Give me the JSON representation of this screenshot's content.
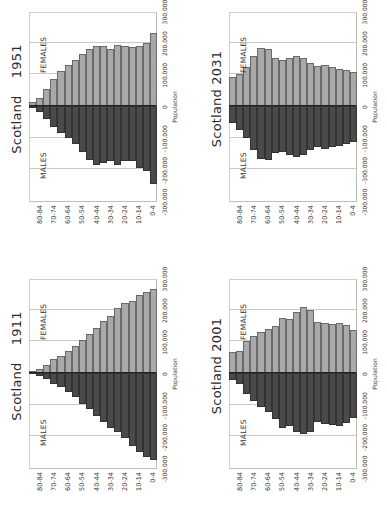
{
  "page": {
    "orientation": "rotated 90 degrees counter-clockwise",
    "shared": {
      "x_axis_title": "Population",
      "male_label": "MALES",
      "female_label": "FEMALES",
      "age_tick_labels": [
        "80-84",
        "70-74",
        "60-64",
        "50-54",
        "40-44",
        "30-34",
        "20-24",
        "10-14",
        "0-4"
      ],
      "colors": {
        "females": "#a9a9a9",
        "males": "#4a4a4a",
        "grid": "#c9c9c9"
      }
    }
  },
  "chart_data": [
    {
      "type": "bar",
      "subtype": "population-pyramid",
      "title": "Scotland    1951",
      "xlabel": "Population",
      "ylabel": "Age group",
      "xlim": [
        -300000,
        300000
      ],
      "x_tick_labels": [
        "-300,000",
        "-200,000",
        "-100,000",
        "0",
        "100,000",
        "200,000",
        "300,000"
      ],
      "grid": true,
      "categories": [
        "85+",
        "80-84",
        "75-79",
        "70-74",
        "65-69",
        "60-64",
        "55-59",
        "50-54",
        "45-49",
        "40-44",
        "35-39",
        "30-34",
        "25-29",
        "20-24",
        "15-19",
        "10-14",
        "5-9",
        "0-4"
      ],
      "category_tick_labels": [
        "80-84",
        "70-74",
        "60-64",
        "50-54",
        "40-44",
        "30-34",
        "20-24",
        "10-14",
        "0-4"
      ],
      "series": [
        {
          "name": "FEMALES",
          "values": [
            12000,
            25000,
            55000,
            85000,
            110000,
            128000,
            145000,
            165000,
            180000,
            190000,
            190000,
            180000,
            193000,
            190000,
            187000,
            190000,
            198000,
            230000
          ]
        },
        {
          "name": "MALES",
          "values": [
            -5000,
            -20000,
            -40000,
            -65000,
            -85000,
            -100000,
            -120000,
            -145000,
            -170000,
            -185000,
            -180000,
            -175000,
            -186000,
            -175000,
            -175000,
            -195000,
            -205000,
            -245000
          ]
        }
      ]
    },
    {
      "type": "bar",
      "subtype": "population-pyramid",
      "title": "Scotland 2031",
      "xlabel": "Population",
      "ylabel": "Age group",
      "xlim": [
        -300000,
        300000
      ],
      "x_tick_labels": [
        "-300,000",
        "-300,000",
        "-100,000",
        "0",
        "100,000",
        "200,000",
        "300,000"
      ],
      "grid": true,
      "categories": [
        "85+",
        "80-84",
        "75-79",
        "70-74",
        "65-69",
        "60-64",
        "55-59",
        "50-54",
        "45-49",
        "40-44",
        "35-39",
        "30-34",
        "25-29",
        "20-24",
        "15-19",
        "10-14",
        "5-9",
        "0-4"
      ],
      "category_tick_labels": [
        "80-84",
        "70-74",
        "60-64",
        "50-54",
        "40-44",
        "30-34",
        "20-24",
        "10-14",
        "0-4"
      ],
      "series": [
        {
          "name": "FEMALES",
          "values": [
            90000,
            100000,
            122000,
            158000,
            182000,
            180000,
            150000,
            145000,
            153000,
            157000,
            153000,
            135000,
            125000,
            130000,
            122000,
            118000,
            113000,
            107000
          ]
        },
        {
          "name": "MALES",
          "values": [
            -55000,
            -75000,
            -100000,
            -138000,
            -168000,
            -172000,
            -148000,
            -145000,
            -155000,
            -160000,
            -155000,
            -140000,
            -130000,
            -135000,
            -130000,
            -125000,
            -120000,
            -115000
          ]
        }
      ]
    },
    {
      "type": "bar",
      "subtype": "population-pyramid",
      "title": "Scotland    1911",
      "xlabel": "Population",
      "ylabel": "Age group",
      "xlim": [
        -300000,
        300000
      ],
      "x_tick_labels": [
        "-300,000",
        "-200,000",
        "-100,000",
        "0",
        "100,000",
        "200,000",
        "300,000"
      ],
      "grid": true,
      "categories": [
        "85+",
        "80-84",
        "75-79",
        "70-74",
        "65-69",
        "60-64",
        "55-59",
        "50-54",
        "45-49",
        "40-44",
        "35-39",
        "30-34",
        "25-29",
        "20-24",
        "15-19",
        "10-14",
        "5-9",
        "0-4"
      ],
      "category_tick_labels": [
        "80-84",
        "70-74",
        "60-64",
        "50-54",
        "40-44",
        "30-34",
        "20-24",
        "10-14",
        "0-4"
      ],
      "series": [
        {
          "name": "FEMALES",
          "values": [
            5000,
            12000,
            25000,
            45000,
            55000,
            68000,
            85000,
            105000,
            122000,
            143000,
            165000,
            180000,
            205000,
            220000,
            228000,
            245000,
            255000,
            265000
          ]
        },
        {
          "name": "MALES",
          "values": [
            -3000,
            -10000,
            -20000,
            -35000,
            -45000,
            -60000,
            -75000,
            -97000,
            -115000,
            -135000,
            -155000,
            -175000,
            -185000,
            -205000,
            -230000,
            -250000,
            -265000,
            -275000
          ]
        }
      ]
    },
    {
      "type": "bar",
      "subtype": "population-pyramid",
      "title": "Scotland 2001",
      "xlabel": "Population",
      "ylabel": "Age group",
      "xlim": [
        -300000,
        300000
      ],
      "x_tick_labels": [
        "-300,000",
        "-200,000",
        "-100,000",
        "0",
        "100,000",
        "200,000",
        "300,000"
      ],
      "grid": true,
      "categories": [
        "85+",
        "80-84",
        "75-79",
        "70-74",
        "65-69",
        "60-64",
        "55-59",
        "50-54",
        "45-49",
        "40-44",
        "35-39",
        "30-34",
        "25-29",
        "20-24",
        "15-19",
        "10-14",
        "5-9",
        "0-4"
      ],
      "category_tick_labels": [
        "80-84",
        "70-74",
        "60-64",
        "50-54",
        "40-44",
        "30-34",
        "20-24",
        "10-14",
        "0-4"
      ],
      "series": [
        {
          "name": "FEMALES",
          "values": [
            65000,
            70000,
            100000,
            118000,
            130000,
            138000,
            147000,
            175000,
            170000,
            193000,
            208000,
            198000,
            162000,
            157000,
            155000,
            157000,
            150000,
            135000
          ]
        },
        {
          "name": "MALES",
          "values": [
            -22000,
            -35000,
            -65000,
            -88000,
            -108000,
            -122000,
            -145000,
            -175000,
            -168000,
            -185000,
            -193000,
            -187000,
            -155000,
            -160000,
            -163000,
            -167000,
            -157000,
            -142000
          ]
        }
      ]
    }
  ],
  "layout": {
    "panels": [
      {
        "id": "1951",
        "left": 5,
        "top": 254
      },
      {
        "id": "2031",
        "left": 205,
        "top": 254
      },
      {
        "id": "1911",
        "left": 5,
        "top": 521
      },
      {
        "id": "2001",
        "left": 205,
        "top": 521
      }
    ]
  }
}
